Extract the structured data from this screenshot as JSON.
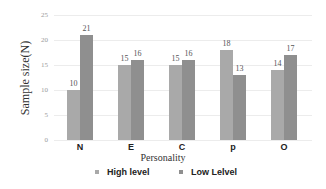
{
  "chart_data": {
    "type": "bar",
    "title": "",
    "xlabel": "Personality",
    "ylabel": "Sample size(N)",
    "categories": [
      "N",
      "E",
      "C",
      "p",
      "O"
    ],
    "series": [
      {
        "name": "High level",
        "values": [
          10,
          15,
          15,
          18,
          14
        ],
        "color": "#a9a9a9"
      },
      {
        "name": "Low Lelvel",
        "values": [
          21,
          16,
          16,
          13,
          17
        ],
        "color": "#8f8f8f"
      }
    ],
    "ylim": [
      0,
      25
    ],
    "yticks": [
      "0",
      "5",
      "10",
      "15",
      "20",
      "25"
    ],
    "grid": true,
    "legend_position": "bottom"
  },
  "labels": {
    "values_high": [
      "10",
      "15",
      "15",
      "18",
      "14"
    ],
    "values_low": [
      "21",
      "16",
      "16",
      "13",
      "17"
    ]
  }
}
